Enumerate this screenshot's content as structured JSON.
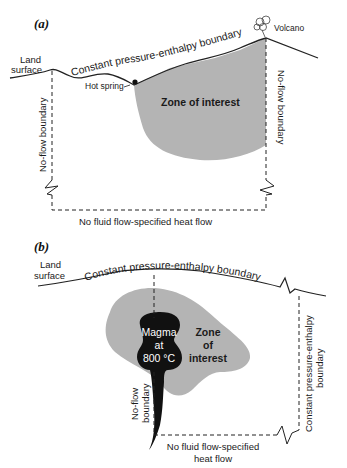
{
  "figure": {
    "panel_a": {
      "label": "(a)",
      "land_surface": [
        "Land",
        "surface"
      ],
      "top_boundary": "Constant pressure-enthalpy boundary",
      "hot_spring": "Hot spring",
      "volcano": "Volcano",
      "zone": "Zone of interest",
      "left_boundary": "No-flow boundary",
      "right_boundary": "No-flow boundary",
      "bottom_boundary": "No fluid flow-specified heat flow"
    },
    "panel_b": {
      "label": "(b)",
      "land_surface": [
        "Land",
        "surface"
      ],
      "top_boundary": "Constant pressure-enthalpy boundary",
      "magma": [
        "Magma",
        "at",
        "800 °C"
      ],
      "zone": [
        "Zone",
        "of",
        "interest"
      ],
      "left_boundary": [
        "No-flow",
        "boundary"
      ],
      "right_boundary": [
        "Constant pressure-enthalpy",
        "boundary"
      ],
      "bottom_boundary": [
        "No fluid flow-specified",
        "heat flow"
      ]
    },
    "colors": {
      "zone_fill": "#b4b4b4",
      "magma_fill": "#111111",
      "line": "#222222"
    }
  }
}
